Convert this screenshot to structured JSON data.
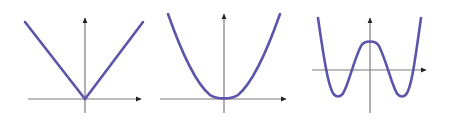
{
  "figure": {
    "width": 450,
    "height": 120,
    "background_color": "#ffffff",
    "axis_color": "#7a7a7a",
    "arrow_color": "#222222",
    "curve_color": "#5b54a8",
    "axis_stroke_width": 1.2,
    "curve_stroke_width": 2.6
  },
  "chart_data": [
    {
      "type": "line",
      "name": "absolute-value-v-graph",
      "title": "",
      "xlabel": "",
      "ylabel": "",
      "grid": false,
      "legend": null,
      "shape": "V",
      "degree_parity": "even",
      "origin_px": [
        85,
        99
      ],
      "xaxis_px": {
        "x1": 28,
        "x2": 143,
        "y": 99
      },
      "yaxis_px": {
        "x": 85,
        "y1": 16,
        "y2": 113
      },
      "x_arrow": "right",
      "y_arrow": "up",
      "vertex": [
        0,
        0
      ],
      "x": [
        -2.0,
        0.0,
        2.0
      ],
      "y": [
        2.7,
        0.0,
        2.7
      ],
      "points_px": [
        [
          25,
          22
        ],
        [
          85,
          99
        ],
        [
          143,
          22
        ]
      ]
    },
    {
      "type": "line",
      "name": "parabola-graph",
      "title": "",
      "xlabel": "",
      "ylabel": "",
      "grid": false,
      "legend": null,
      "shape": "U",
      "degree_parity": "even",
      "origin_px": [
        224,
        99
      ],
      "xaxis_px": {
        "x1": 160,
        "x2": 288,
        "y": 99
      },
      "yaxis_px": {
        "x": 224,
        "y1": 12,
        "y2": 113
      },
      "vertex": [
        0,
        0
      ],
      "x": [
        -2.0,
        -1.0,
        0.0,
        1.0,
        2.0
      ],
      "y": [
        3.0,
        0.75,
        0.0,
        0.75,
        3.0
      ],
      "points_px": [
        [
          168,
          14
        ],
        [
          196,
          66
        ],
        [
          224,
          99
        ],
        [
          252,
          66
        ],
        [
          280,
          14
        ]
      ]
    },
    {
      "type": "line",
      "name": "quartic-w-graph",
      "title": "",
      "xlabel": "",
      "ylabel": "",
      "grid": false,
      "legend": null,
      "shape": "W",
      "degree_parity": "even",
      "origin_px": [
        370,
        70
      ],
      "xaxis_px": {
        "x1": 312,
        "x2": 428,
        "y": 70
      },
      "yaxis_px": {
        "x": 370,
        "y1": 16,
        "y2": 113
      },
      "x_intercepts_px": [
        327,
        352,
        387,
        410
      ],
      "local_max_px": [
        370,
        37
      ],
      "local_min_px": [
        [
          338,
          96
        ],
        [
          400,
          96
        ]
      ],
      "x": [
        -2.3,
        -1.6,
        -1.05,
        0.0,
        1.05,
        1.6,
        2.3
      ],
      "y": [
        3.2,
        -1.4,
        0.0,
        1.6,
        0.0,
        -1.4,
        3.2
      ],
      "points_px": [
        [
          318,
          18
        ],
        [
          338,
          96
        ],
        [
          352,
          70
        ],
        [
          370,
          37
        ],
        [
          387,
          70
        ],
        [
          400,
          96
        ],
        [
          421,
          18
        ]
      ]
    }
  ]
}
